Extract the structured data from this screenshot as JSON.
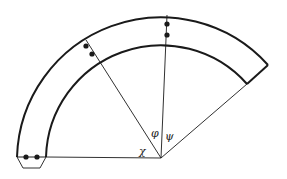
{
  "diagram": {
    "type": "curved-band-sector",
    "stroke_color": "#1a1a1a",
    "background": "#ffffff",
    "center": [
      161,
      158
    ],
    "outer_radius": 144,
    "inner_radius": 115,
    "angles": {
      "chi": {
        "label": "χ"
      },
      "phi": {
        "label": "φ"
      },
      "psi": {
        "label": "ψ"
      }
    },
    "markers": [
      {
        "name": "left-end-dots",
        "count": 2
      },
      {
        "name": "upper-left-dots",
        "count": 2
      },
      {
        "name": "top-dots",
        "count": 2
      }
    ]
  }
}
